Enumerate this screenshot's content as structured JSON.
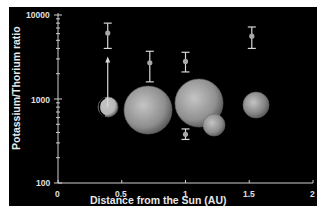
{
  "chart_data": {
    "type": "scatter",
    "title": "",
    "xlabel": "Distance from the Sun (AU)",
    "ylabel": "Potassium/Thorium ratio",
    "xlim": [
      0,
      2
    ],
    "ylim": [
      100,
      10000
    ],
    "yscale": "log",
    "x_ticks": [
      "0",
      "0.5",
      "1",
      "1.5",
      "2"
    ],
    "y_ticks": [
      "100",
      "1000",
      "10000"
    ],
    "grid": false,
    "legend": null,
    "background": "#000000",
    "points": [
      {
        "label": "Mercury",
        "x": 0.39,
        "y": 6100,
        "err_low": 4000,
        "err_high": 8000,
        "lower_limit_arrow_from": 800
      },
      {
        "label": "Venus",
        "x": 0.72,
        "y": 2700,
        "err_low": 1600,
        "err_high": 3700
      },
      {
        "label": "Earth",
        "x": 1.0,
        "y": 2800,
        "err_low": 2100,
        "err_high": 3600
      },
      {
        "label": "Moon",
        "x": 1.0,
        "y": 380,
        "err_low": 330,
        "err_high": 440
      },
      {
        "label": "Mars",
        "x": 1.52,
        "y": 5600,
        "err_low": 4000,
        "err_high": 7200
      }
    ],
    "planet_images": [
      {
        "label": "Mercury",
        "cx": 108,
        "cy": 107,
        "r": 10,
        "color": "#b8b8b8"
      },
      {
        "label": "Venus",
        "cx": 148,
        "cy": 110,
        "r": 24,
        "color": "#8e8e8e"
      },
      {
        "label": "Earth",
        "cx": 199,
        "cy": 103,
        "r": 24,
        "color": "#909090"
      },
      {
        "label": "Moon",
        "cx": 214,
        "cy": 125,
        "r": 11,
        "color": "#8a8a8a"
      },
      {
        "label": "Mars",
        "cx": 256,
        "cy": 105,
        "r": 13,
        "color": "#828282"
      }
    ]
  }
}
